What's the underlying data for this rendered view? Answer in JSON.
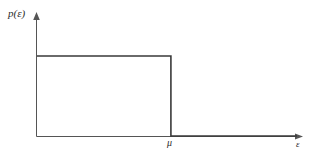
{
  "chart_data": {
    "type": "line",
    "title": "",
    "subtitle": "",
    "xlabel": "ε",
    "ylabel": "p(ε)",
    "x": [
      0,
      137,
      137,
      266
    ],
    "values": [
      1,
      1,
      0,
      0
    ],
    "series": [
      {
        "name": "p(ε)",
        "values": [
          1,
          1,
          0,
          0
        ]
      }
    ],
    "annotations": [
      {
        "name": "chemical-potential",
        "text": "μ",
        "axis": "x",
        "value": 137
      }
    ],
    "xlim": [
      0,
      266
    ],
    "ylim": [
      0,
      1.22
    ],
    "grid": false,
    "legend": false,
    "legend_position": "none",
    "ticks": {
      "x": [
        "μ"
      ],
      "y": []
    }
  },
  "axes": {
    "y_axis_label": "p(ε)",
    "x_axis_label": "ε",
    "x_tick_label": "μ"
  },
  "style": {
    "curve_color": "#3a3a3a",
    "axis_color": "#555555",
    "background": "#ffffff",
    "text_color": "#2b2b2b"
  }
}
